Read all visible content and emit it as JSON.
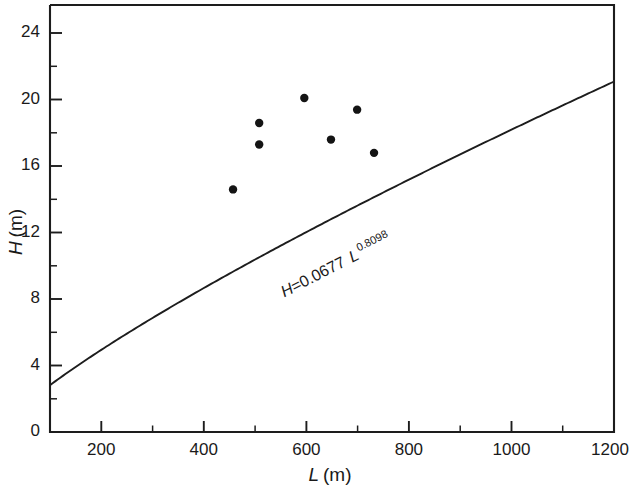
{
  "chart_data": {
    "type": "scatter",
    "title": "",
    "subtitle": "",
    "xlabel": "L (m)",
    "ylabel": "H (m)",
    "xlabel_var": "L",
    "xlabel_unit": "(m)",
    "ylabel_var": "H",
    "ylabel_unit": "(m)",
    "xlim": [
      100,
      1200
    ],
    "ylim": [
      0,
      25.7
    ],
    "grid": false,
    "legend": null,
    "x_major_ticks": [
      200,
      400,
      600,
      800,
      1000,
      1200
    ],
    "x_major_tick_labels": [
      "200",
      "400",
      "600",
      "800",
      "1000",
      "1200"
    ],
    "x_minor_ticks": [
      100,
      300,
      500,
      700,
      900,
      1100
    ],
    "y_major_ticks": [
      0,
      4,
      8,
      12,
      16,
      20,
      24
    ],
    "y_major_tick_labels": [
      "0",
      "4",
      "8",
      "12",
      "16",
      "20",
      "24"
    ],
    "y_minor_ticks": [
      2,
      6,
      10,
      14,
      18,
      22
    ],
    "tick_direction": "in",
    "series": [
      {
        "name": "measured data",
        "type": "scatter",
        "marker": "filled-circle",
        "color": "#141414",
        "points": [
          {
            "x": 457,
            "y": 14.6
          },
          {
            "x": 508,
            "y": 18.6
          },
          {
            "x": 508,
            "y": 17.3
          },
          {
            "x": 596,
            "y": 20.1
          },
          {
            "x": 648,
            "y": 17.6
          },
          {
            "x": 699,
            "y": 19.4
          },
          {
            "x": 732,
            "y": 16.8
          }
        ]
      },
      {
        "name": "power-law fit",
        "type": "line",
        "color": "#1d1d1d",
        "equation": "H=0.0677 L^0.8098",
        "coefficient": 0.0677,
        "exponent": 0.8098,
        "x_range": [
          100,
          1200
        ],
        "y_range": [
          2.81,
          20.93
        ]
      }
    ],
    "annotations": [
      {
        "name": "fit-equation",
        "text_prefix": "H",
        "text_equals": "=0.0677 ",
        "text_var": "L",
        "text_exponent": "0.8098",
        "full_text": "H=0.0677 L 0.8098",
        "x": 620,
        "y": 8.8,
        "rotation_deg": -27
      }
    ]
  }
}
